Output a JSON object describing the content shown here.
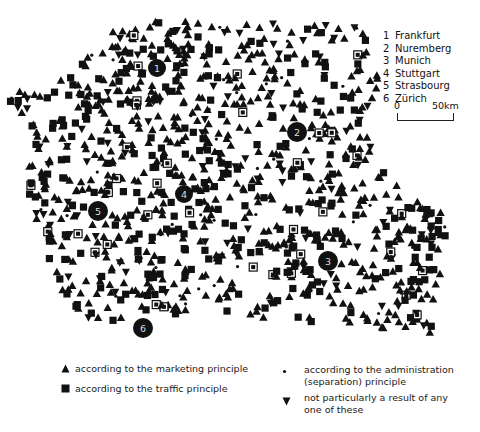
{
  "map": {
    "title": "",
    "symbol_color": "#111111",
    "background": "#ffffff",
    "cities": [
      {
        "num": "1",
        "name": "Frankfurt",
        "x": 157,
        "y": 68,
        "r": 9
      },
      {
        "num": "2",
        "name": "Nuremberg",
        "x": 297,
        "y": 132,
        "r": 10
      },
      {
        "num": "3",
        "name": "Munich",
        "x": 328,
        "y": 261,
        "r": 10
      },
      {
        "num": "4",
        "name": "Stuttgart",
        "x": 184,
        "y": 194,
        "r": 9
      },
      {
        "num": "5",
        "name": "Strasbourg",
        "x": 98,
        "y": 211,
        "r": 10
      },
      {
        "num": "6",
        "name": "Zürich",
        "x": 143,
        "y": 328,
        "r": 10
      }
    ],
    "scale": {
      "start_label": "0",
      "end_label": "50km"
    }
  },
  "legend": {
    "items": [
      {
        "symbol": "triangle-up-icon",
        "label": "according to the marketing principle"
      },
      {
        "symbol": "square-icon",
        "label": "according to the traffic principle"
      },
      {
        "symbol": "dot-icon",
        "label_line1": "according to the administration",
        "label_line2": "(separation) principle"
      },
      {
        "symbol": "triangle-down-icon",
        "label_line1": "not particularly a result of any",
        "label_line2": "one of these"
      }
    ]
  }
}
